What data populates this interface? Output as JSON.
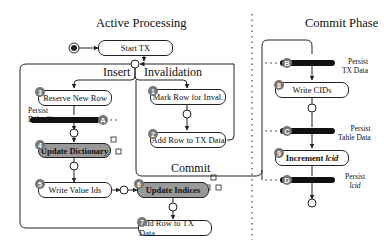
{
  "titles": {
    "left": "Active Processing",
    "right": "Commit Phase"
  },
  "sections": {
    "insert": "Insert",
    "invalidation": "Invalidation",
    "commit": "Commit"
  },
  "nodes": {
    "start": "Start TX",
    "reserve": "Reserve New Row",
    "dict": "Update Dictionary",
    "valueids": "Write Value Ids",
    "indices": "Update Indices",
    "addrow_insert": "Add Row to TX Data",
    "markrow": "Mark Row for Inval.",
    "addrow_inval": "Add Row to TX Data",
    "cids": "Write CIDs",
    "lcid_prefix": "Increment ",
    "lcid_italic": "lcid"
  },
  "badges": [
    "1",
    "2",
    "3",
    "4",
    "5",
    "6",
    "7",
    "8",
    "9"
  ],
  "persist_badges": [
    "A",
    "B",
    "C",
    "D"
  ],
  "persist": {
    "delta1": "Persist",
    "delta2": "Delta Size",
    "tx1": "Persist",
    "tx2": "TX Data",
    "table1": "Persist",
    "table2": "Table Data",
    "lcid1": "Persist",
    "lcid2": "lcid"
  }
}
